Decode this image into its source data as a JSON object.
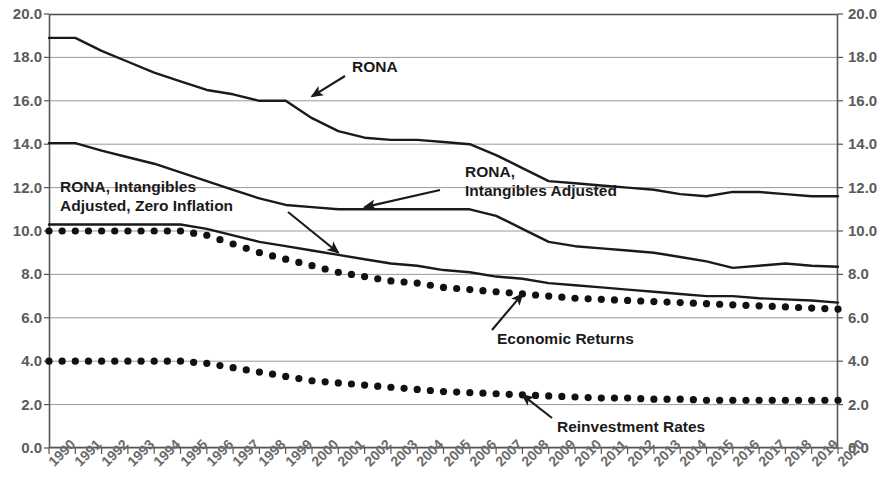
{
  "chart_data": {
    "type": "line",
    "title": "",
    "subtitle": "",
    "xlabel": "",
    "ylabel": "",
    "ylim": [
      0.0,
      20.0
    ],
    "xlim": [
      1990,
      2020
    ],
    "grid": true,
    "legend_position": "inline-annotations",
    "dual_y_axis": true,
    "y_ticks": [
      0.0,
      2.0,
      4.0,
      6.0,
      8.0,
      10.0,
      12.0,
      14.0,
      16.0,
      18.0,
      20.0
    ],
    "y_tick_labels": [
      "0.0",
      "2.0",
      "4.0",
      "6.0",
      "8.0",
      "10.0",
      "12.0",
      "14.0",
      "16.0",
      "18.0",
      "20.0"
    ],
    "y_ticks_right": [
      0.0,
      2.0,
      4.0,
      6.0,
      8.0,
      10.0,
      12.0,
      14.0,
      16.0,
      18.0,
      20.0
    ],
    "y_tick_labels_right": [
      "0.0",
      "2.0",
      "4.0",
      "6.0",
      "8.0",
      "10.0",
      "12.0",
      "14.0",
      "16.0",
      "18.0",
      "20.0"
    ],
    "categories": [
      "1990",
      "1991",
      "1992",
      "1993",
      "1994",
      "1995",
      "1996",
      "1997",
      "1998",
      "1999",
      "2000",
      "2001",
      "2002",
      "2003",
      "2004",
      "2005",
      "2006",
      "2007",
      "2008",
      "2009",
      "2010",
      "2011",
      "2012",
      "2013",
      "2014",
      "2015",
      "2016",
      "2017",
      "2018",
      "2019",
      "2020"
    ],
    "x": [
      1990,
      1991,
      1992,
      1993,
      1994,
      1995,
      1996,
      1997,
      1998,
      1999,
      2000,
      2001,
      2002,
      2003,
      2004,
      2005,
      2006,
      2007,
      2008,
      2009,
      2010,
      2011,
      2012,
      2013,
      2014,
      2015,
      2016,
      2017,
      2018,
      2019,
      2020
    ],
    "series": [
      {
        "name": "RONA",
        "style": "solid",
        "color": "#1a1a1a",
        "values": [
          18.9,
          18.9,
          18.3,
          17.8,
          17.3,
          16.9,
          16.5,
          16.3,
          16.0,
          16.0,
          15.2,
          14.6,
          14.3,
          14.2,
          14.2,
          14.1,
          14.0,
          13.5,
          12.9,
          12.3,
          12.2,
          12.1,
          12.0,
          11.9,
          11.7,
          11.6,
          11.8,
          11.8,
          11.7,
          11.6,
          11.6
        ]
      },
      {
        "name": "RONA, Intangibles Adjusted",
        "style": "solid",
        "color": "#1a1a1a",
        "values": [
          14.05,
          14.05,
          13.7,
          13.4,
          13.1,
          12.7,
          12.3,
          11.9,
          11.5,
          11.2,
          11.1,
          11.0,
          11.0,
          11.0,
          11.0,
          11.0,
          11.0,
          10.7,
          10.1,
          9.5,
          9.3,
          9.2,
          9.1,
          9.0,
          8.8,
          8.6,
          8.3,
          8.4,
          8.5,
          8.4,
          8.35
        ]
      },
      {
        "name": "RONA, Intangibles Adjusted, Zero Inflation",
        "style": "solid",
        "color": "#1a1a1a",
        "values": [
          10.3,
          10.3,
          10.3,
          10.3,
          10.3,
          10.3,
          10.1,
          9.8,
          9.5,
          9.3,
          9.1,
          8.9,
          8.7,
          8.5,
          8.4,
          8.2,
          8.1,
          7.9,
          7.8,
          7.6,
          7.5,
          7.4,
          7.3,
          7.2,
          7.1,
          7.0,
          7.0,
          6.9,
          6.85,
          6.8,
          6.7
        ]
      },
      {
        "name": "Economic Returns",
        "style": "dotted",
        "color": "#111111",
        "values": [
          10.0,
          10.0,
          10.0,
          10.0,
          10.0,
          10.0,
          9.8,
          9.4,
          9.0,
          8.7,
          8.4,
          8.1,
          7.9,
          7.7,
          7.6,
          7.4,
          7.3,
          7.2,
          7.1,
          7.0,
          6.9,
          6.85,
          6.8,
          6.75,
          6.7,
          6.65,
          6.6,
          6.55,
          6.5,
          6.45,
          6.4
        ]
      },
      {
        "name": "Reinvestment Rates",
        "style": "dotted",
        "color": "#111111",
        "values": [
          4.0,
          4.0,
          4.0,
          4.0,
          4.0,
          4.0,
          3.9,
          3.7,
          3.5,
          3.3,
          3.1,
          3.0,
          2.9,
          2.8,
          2.7,
          2.6,
          2.55,
          2.5,
          2.45,
          2.4,
          2.35,
          2.3,
          2.3,
          2.25,
          2.25,
          2.2,
          2.2,
          2.2,
          2.2,
          2.2,
          2.2
        ]
      }
    ],
    "annotations": [
      {
        "id": "rona",
        "text": "RONA",
        "lines": [
          "RONA"
        ],
        "target_x": 2000,
        "target_y": 16.2
      },
      {
        "id": "rona-intangibles-adjusted",
        "text": "RONA, Intangibles Adjusted",
        "lines": [
          "RONA,",
          "Intangibles Adjusted"
        ],
        "target_x": 2002,
        "target_y": 11.1
      },
      {
        "id": "rona-intangibles-adjusted-zero-inflation",
        "text": "RONA, Intangibles Adjusted, Zero Inflation",
        "lines": [
          "RONA, Intangibles",
          "Adjusted, Zero Inflation"
        ],
        "target_x": 2001,
        "target_y": 9.0
      },
      {
        "id": "economic-returns",
        "text": "Economic Returns",
        "lines": [
          "Economic Returns"
        ],
        "target_x": 2008,
        "target_y": 7.1
      },
      {
        "id": "reinvestment-rates",
        "text": "Reinvestment Rates",
        "lines": [
          "Reinvestment Rates"
        ],
        "target_x": 2008,
        "target_y": 2.45
      }
    ]
  },
  "colors": {
    "line": "#1a1a1a",
    "dot": "#111111",
    "grid": "#9a9a9a",
    "frame": "#555555",
    "tick_text": "#626262",
    "annotation_text": "#1a1a1a",
    "background": "#ffffff"
  }
}
